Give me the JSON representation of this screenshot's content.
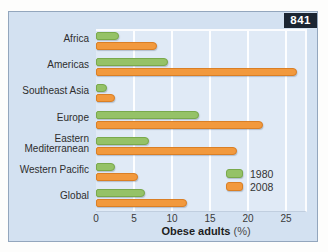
{
  "page": {
    "figure_badge": "841"
  },
  "chart_data": {
    "type": "bar",
    "orientation": "horizontal",
    "title": "",
    "xlabel_bold": "Obese adults",
    "xlabel_unit": " (%)",
    "ylabel": "",
    "categories": [
      "Africa",
      "Americas",
      "Southeast Asia",
      "Europe",
      "Eastern Mediterranean",
      "Western Pacific",
      "Global"
    ],
    "series": [
      {
        "name": "1980",
        "color": "#95c267",
        "border_color": "#79a94b",
        "values": [
          3,
          9.5,
          1.5,
          13.5,
          7,
          2.5,
          6.5
        ]
      },
      {
        "name": "2008",
        "color": "#f2993d",
        "border_color": "#da7f25",
        "values": [
          8,
          26.5,
          2.5,
          22,
          18.5,
          5.5,
          12
        ]
      }
    ],
    "xticks": [
      0,
      5,
      10,
      15,
      20,
      25
    ],
    "xlim": [
      0,
      27.5
    ],
    "grid": "vertical-white-gridlines",
    "legend_position": "inside-bottom-right",
    "panel_color": "#d3e1f1",
    "plot_color": "#e0eaf6"
  }
}
